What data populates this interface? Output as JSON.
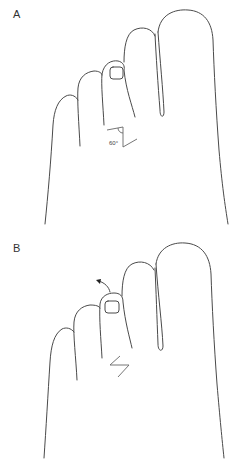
{
  "figure": {
    "panels": [
      {
        "id": "A",
        "label": "A",
        "annotation": "60°",
        "description": "Dorsal view of forefoot with Z-plasty incision marked at base of third toe, limb angle 60°"
      },
      {
        "id": "B",
        "label": "B",
        "annotation": "",
        "description": "Dorsal view after transposition of Z-plasty flaps with arrow showing rotation of third toe"
      }
    ],
    "colors": {
      "outline": "#4a4a4a",
      "background": "#ffffff"
    }
  }
}
